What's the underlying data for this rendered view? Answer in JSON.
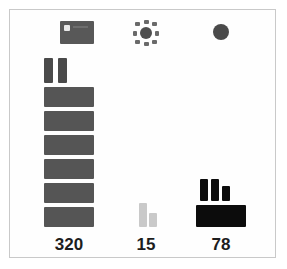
{
  "chart_data": {
    "type": "bar",
    "title": "",
    "subtitle": "",
    "xlabel": "",
    "ylabel": "",
    "grid": false,
    "legend": "none",
    "style": "pictogram-unit-chart",
    "categories": [
      "320",
      "15",
      "78"
    ],
    "values": [
      320,
      15,
      78
    ],
    "tick_labels": [
      "320",
      "15",
      "78"
    ],
    "annotations": [],
    "series": [
      {
        "name": "units",
        "values": [
          320,
          15,
          78
        ]
      }
    ]
  },
  "figure": {
    "background_color": "#ffffff",
    "frame_color": "#c9c9c9"
  },
  "columns": [
    {
      "id": "column-left",
      "icon_name": "flag-icon",
      "value_label": "320",
      "bar_color": "#555555",
      "accent_color": "#4a4a4a",
      "left_px": 38,
      "width_px": 62,
      "full_blocks": 6,
      "full_block_width": 50,
      "full_block_height": 20,
      "full_block_gap": 4,
      "partial_bars": [
        {
          "width": 9,
          "height": 25,
          "offset_x": 0
        },
        {
          "width": 9,
          "height": 25,
          "offset_x": 14
        }
      ]
    },
    {
      "id": "column-middle",
      "icon_name": "sunburst-icon",
      "value_label": "15",
      "bar_color": "#cfcfcf",
      "accent_color": "#c9c9c9",
      "left_px": 118,
      "width_px": 56,
      "full_blocks": 0,
      "full_block_width": 50,
      "full_block_height": 20,
      "full_block_gap": 4,
      "partial_bars": [
        {
          "width": 8,
          "height": 24,
          "offset_x": 18
        },
        {
          "width": 8,
          "height": 14,
          "offset_x": 28
        }
      ]
    },
    {
      "id": "column-right",
      "icon_name": "dot-icon",
      "value_label": "78",
      "bar_color": "#0c0c0c",
      "accent_color": "#0c0c0c",
      "left_px": 190,
      "width_px": 62,
      "full_blocks": 1,
      "full_block_width": 50,
      "full_block_height": 22,
      "full_block_gap": 4,
      "partial_bars": [
        {
          "width": 8,
          "height": 22,
          "offset_x": 4
        },
        {
          "width": 8,
          "height": 22,
          "offset_x": 15
        },
        {
          "width": 8,
          "height": 15,
          "offset_x": 26
        }
      ]
    }
  ]
}
